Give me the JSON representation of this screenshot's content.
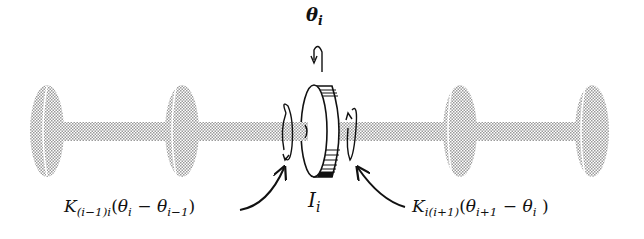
{
  "diagram": {
    "type": "torsional-shaft-system",
    "colors": {
      "stipple": "#bdbdbd",
      "ink": "#111111",
      "background": "#ffffff"
    },
    "labels": {
      "theta": {
        "symbol": "θ",
        "sub": "i"
      },
      "inertia": {
        "symbol": "I",
        "sub": "i"
      },
      "left_torque": {
        "K": "K",
        "K_sub": "(i−1)i",
        "open": "(",
        "t1": "θ",
        "t1_sub": "i",
        "minus": " − ",
        "t2": "θ",
        "t2_sub": "i−1",
        "close": ")"
      },
      "right_torque": {
        "K": "K",
        "K_sub": "i(i+1)",
        "open": "(",
        "t1": "θ",
        "t1_sub": "i+1",
        "minus": " − ",
        "t2": "θ",
        "t2_sub": "i",
        "close": " )"
      }
    },
    "disks": [
      {
        "name": "disk-1",
        "cx": 47
      },
      {
        "name": "disk-2",
        "cx": 182
      },
      {
        "name": "disk-4",
        "cx": 460
      },
      {
        "name": "disk-5",
        "cx": 592
      }
    ]
  }
}
